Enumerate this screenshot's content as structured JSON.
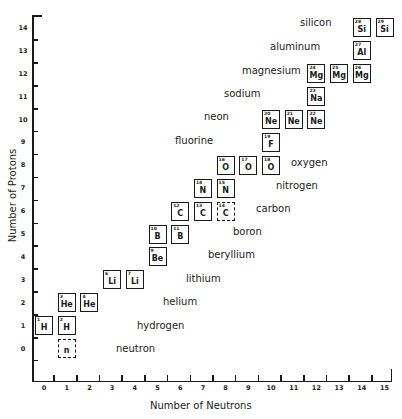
{
  "chart_data": {
    "type": "scatter",
    "title": "",
    "xlabel": "Number of Neutrons",
    "ylabel": "Number of Protons",
    "xlim": [
      0,
      15
    ],
    "ylim": [
      0,
      14
    ],
    "x_ticks": [
      "0",
      "1",
      "2",
      "3",
      "4",
      "5",
      "6",
      "7",
      "8",
      "9",
      "10",
      "11",
      "12",
      "13",
      "14",
      "15"
    ],
    "y_ticks": [
      "0",
      "1",
      "2",
      "3",
      "4",
      "5",
      "6",
      "7",
      "8",
      "9",
      "10",
      "11",
      "12",
      "13",
      "14"
    ],
    "grid": false,
    "legend": "none",
    "nuclides": [
      {
        "symbol": "n",
        "mass": "",
        "neutrons": 1,
        "protons": 0,
        "dashed": true
      },
      {
        "symbol": "H",
        "mass": "1",
        "neutrons": 0,
        "protons": 1,
        "dashed": false
      },
      {
        "symbol": "H",
        "mass": "2",
        "neutrons": 1,
        "protons": 1,
        "dashed": false
      },
      {
        "symbol": "He",
        "mass": "3",
        "neutrons": 1,
        "protons": 2,
        "dashed": false
      },
      {
        "symbol": "He",
        "mass": "4",
        "neutrons": 2,
        "protons": 2,
        "dashed": false
      },
      {
        "symbol": "Li",
        "mass": "6",
        "neutrons": 3,
        "protons": 3,
        "dashed": false
      },
      {
        "symbol": "Li",
        "mass": "7",
        "neutrons": 4,
        "protons": 3,
        "dashed": false
      },
      {
        "symbol": "Be",
        "mass": "9",
        "neutrons": 5,
        "protons": 4,
        "dashed": false
      },
      {
        "symbol": "B",
        "mass": "10",
        "neutrons": 5,
        "protons": 5,
        "dashed": false
      },
      {
        "symbol": "B",
        "mass": "11",
        "neutrons": 6,
        "protons": 5,
        "dashed": false
      },
      {
        "symbol": "C",
        "mass": "12",
        "neutrons": 6,
        "protons": 6,
        "dashed": false
      },
      {
        "symbol": "C",
        "mass": "13",
        "neutrons": 7,
        "protons": 6,
        "dashed": false
      },
      {
        "symbol": "C",
        "mass": "14",
        "neutrons": 8,
        "protons": 6,
        "dashed": true
      },
      {
        "symbol": "N",
        "mass": "14",
        "neutrons": 7,
        "protons": 7,
        "dashed": false
      },
      {
        "symbol": "N",
        "mass": "15",
        "neutrons": 8,
        "protons": 7,
        "dashed": false
      },
      {
        "symbol": "O",
        "mass": "16",
        "neutrons": 8,
        "protons": 8,
        "dashed": false
      },
      {
        "symbol": "O",
        "mass": "17",
        "neutrons": 9,
        "protons": 8,
        "dashed": false
      },
      {
        "symbol": "O",
        "mass": "18",
        "neutrons": 10,
        "protons": 8,
        "dashed": false
      },
      {
        "symbol": "F",
        "mass": "19",
        "neutrons": 10,
        "protons": 9,
        "dashed": false
      },
      {
        "symbol": "Ne",
        "mass": "20",
        "neutrons": 10,
        "protons": 10,
        "dashed": false
      },
      {
        "symbol": "Ne",
        "mass": "21",
        "neutrons": 11,
        "protons": 10,
        "dashed": false
      },
      {
        "symbol": "Ne",
        "mass": "22",
        "neutrons": 12,
        "protons": 10,
        "dashed": false
      },
      {
        "symbol": "Na",
        "mass": "23",
        "neutrons": 12,
        "protons": 11,
        "dashed": false
      },
      {
        "symbol": "Mg",
        "mass": "24",
        "neutrons": 12,
        "protons": 12,
        "dashed": false
      },
      {
        "symbol": "Mg",
        "mass": "25",
        "neutrons": 13,
        "protons": 12,
        "dashed": false
      },
      {
        "symbol": "Mg",
        "mass": "26",
        "neutrons": 14,
        "protons": 12,
        "dashed": false
      },
      {
        "symbol": "Al",
        "mass": "27",
        "neutrons": 14,
        "protons": 13,
        "dashed": false
      },
      {
        "symbol": "Si",
        "mass": "28",
        "neutrons": 14,
        "protons": 14,
        "dashed": false
      },
      {
        "symbol": "Si",
        "mass": "29",
        "neutrons": 15,
        "protons": 14,
        "dashed": false
      }
    ],
    "annotations": [
      {
        "text": "neutron",
        "x": 116,
        "y": 343
      },
      {
        "text": "hydrogen",
        "x": 137,
        "y": 320
      },
      {
        "text": "helium",
        "x": 163,
        "y": 296
      },
      {
        "text": "lithium",
        "x": 186,
        "y": 273
      },
      {
        "text": "beryllium",
        "x": 208,
        "y": 249
      },
      {
        "text": "boron",
        "x": 233,
        "y": 226
      },
      {
        "text": "carbon",
        "x": 256,
        "y": 203
      },
      {
        "text": "nitrogen",
        "x": 276,
        "y": 180
      },
      {
        "text": "oxygen",
        "x": 291,
        "y": 157
      },
      {
        "text": "fluorine",
        "x": 175,
        "y": 135
      },
      {
        "text": "neon",
        "x": 204,
        "y": 111
      },
      {
        "text": "sodium",
        "x": 224,
        "y": 88
      },
      {
        "text": "magnesium",
        "x": 242,
        "y": 65
      },
      {
        "text": "aluminum",
        "x": 270,
        "y": 41
      },
      {
        "text": "silicon",
        "x": 300,
        "y": 17
      }
    ]
  }
}
